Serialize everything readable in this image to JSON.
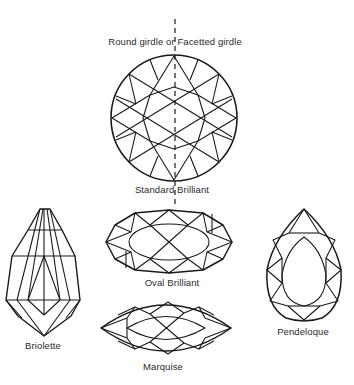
{
  "diagram": {
    "labels": {
      "girdle": "Round girdle or Facetted girdle",
      "standard_brilliant": "Standard Brilliant",
      "oval_brilliant": "Oval Brilliant",
      "marquise": "Marquise",
      "briolette": "Briolette",
      "pendeloque": "Pendeloque"
    },
    "colors": {
      "line": "#1a1a1a",
      "text": "#2a2a2a",
      "background": "#ffffff"
    }
  }
}
